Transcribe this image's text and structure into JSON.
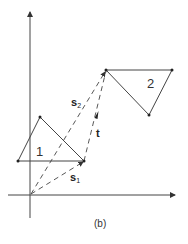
{
  "diagram": {
    "caption": "(b)",
    "triangle_labels": {
      "t1": "1",
      "t2": "2"
    },
    "vectors": {
      "s1": {
        "base": "s",
        "sub": "1"
      },
      "s2": {
        "base": "s",
        "sub": "2"
      },
      "t": {
        "label": "t"
      }
    },
    "colors": {
      "stroke": "#333333",
      "background": "#ffffff"
    }
  }
}
